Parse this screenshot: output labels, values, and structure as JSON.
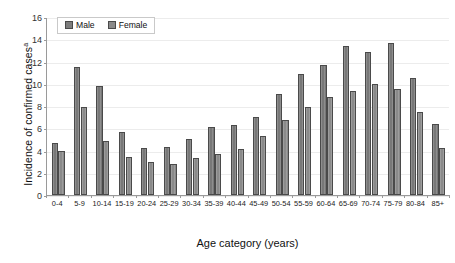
{
  "chart_data": {
    "type": "bar",
    "title": "",
    "xlabel": "Age category (years)",
    "ylabel": "Incidence of confirmed cases",
    "ylabel_superscript": "a",
    "ylim": [
      0,
      16
    ],
    "yticks": [
      0,
      2,
      4,
      6,
      8,
      10,
      12,
      14,
      16
    ],
    "grid": true,
    "legend_position": "top-left",
    "categories": [
      "0-4",
      "5-9",
      "10-14",
      "15-19",
      "20-24",
      "25-29",
      "30-34",
      "35-39",
      "40-44",
      "45-49",
      "50-54",
      "55-59",
      "60-64",
      "65-69",
      "70-74",
      "75-79",
      "80-84",
      "85+"
    ],
    "series": [
      {
        "name": "Male",
        "color": "#787878",
        "values": [
          4.7,
          11.5,
          9.8,
          5.7,
          4.2,
          4.3,
          5.0,
          6.15,
          6.3,
          7.05,
          9.1,
          10.9,
          11.7,
          13.35,
          12.85,
          13.65,
          10.55,
          6.35
        ]
      },
      {
        "name": "Female",
        "color": "#8a8a8a",
        "values": [
          4.0,
          7.9,
          4.9,
          3.4,
          3.0,
          2.8,
          3.35,
          3.7,
          4.1,
          5.3,
          6.7,
          7.95,
          8.8,
          9.35,
          9.95,
          9.55,
          7.45,
          4.2
        ]
      }
    ]
  }
}
